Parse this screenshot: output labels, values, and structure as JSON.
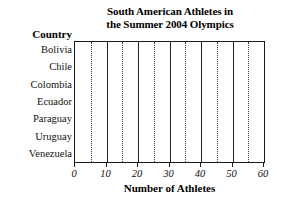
{
  "chart_data": {
    "type": "bar",
    "orientation": "horizontal",
    "title": "South American Athletes in the Summer 2004 Olympics",
    "title_lines": [
      "South American Athletes in",
      "the Summer 2004 Olympics"
    ],
    "categories": [
      "Bolivia",
      "Chile",
      "Colombia",
      "Ecuador",
      "Paraguay",
      "Uruguay",
      "Venezuela"
    ],
    "values": [
      null,
      null,
      null,
      null,
      null,
      null,
      null
    ],
    "series": [
      {
        "name": "Number of Athletes",
        "values": [
          null,
          null,
          null,
          null,
          null,
          null,
          null
        ]
      }
    ],
    "category_axis_label": "Country",
    "xlabel": "Number of Athletes",
    "ylabel": "Country",
    "xlim": [
      0,
      60
    ],
    "xticks": [
      0,
      10,
      20,
      30,
      40,
      50,
      60
    ],
    "xtick_labels": [
      "0",
      "10",
      "20",
      "30",
      "40",
      "50",
      "60"
    ],
    "minor_xticks": [
      5,
      15,
      25,
      35,
      45,
      55
    ],
    "grid": {
      "major_vertical": true,
      "major_style": "solid",
      "minor_vertical": true,
      "minor_style": "dotted",
      "horizontal": false
    },
    "legend": null,
    "legend_position": "none",
    "colors": {
      "background": "#ffffff",
      "frame": "#1a1a1a",
      "major_gridline": "#222222",
      "minor_gridline": "#3a3a3a",
      "text": "#111111"
    }
  }
}
